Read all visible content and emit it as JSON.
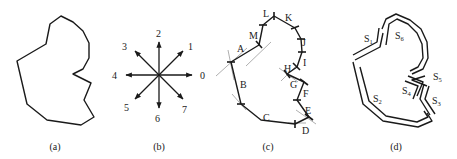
{
  "figure": {
    "panels": [
      {
        "id": "a",
        "caption": "(a)",
        "description": "Closed polygon contour"
      },
      {
        "id": "b",
        "caption": "(b)",
        "description": "8-direction chain code",
        "directions": [
          "0",
          "1",
          "2",
          "3",
          "4",
          "5",
          "6",
          "7"
        ]
      },
      {
        "id": "c",
        "caption": "(c)",
        "description": "Contour segmented with tick marks and labeled edges",
        "segment_labels": [
          "A",
          "B",
          "C",
          "D",
          "E",
          "F",
          "G",
          "H",
          "I",
          "J",
          "K",
          "L",
          "M"
        ]
      },
      {
        "id": "d",
        "caption": "(d)",
        "description": "Contour partitioned into parallel-line strokes",
        "stroke_labels": [
          {
            "base": "S",
            "sub": "1"
          },
          {
            "base": "S",
            "sub": "2"
          },
          {
            "base": "S",
            "sub": "3"
          },
          {
            "base": "S",
            "sub": "4"
          },
          {
            "base": "S",
            "sub": "5"
          },
          {
            "base": "S",
            "sub": "6"
          }
        ]
      }
    ]
  },
  "colors": {
    "line": "#1a1a1a",
    "guide": "#9a9a9a",
    "background": "#ffffff"
  }
}
